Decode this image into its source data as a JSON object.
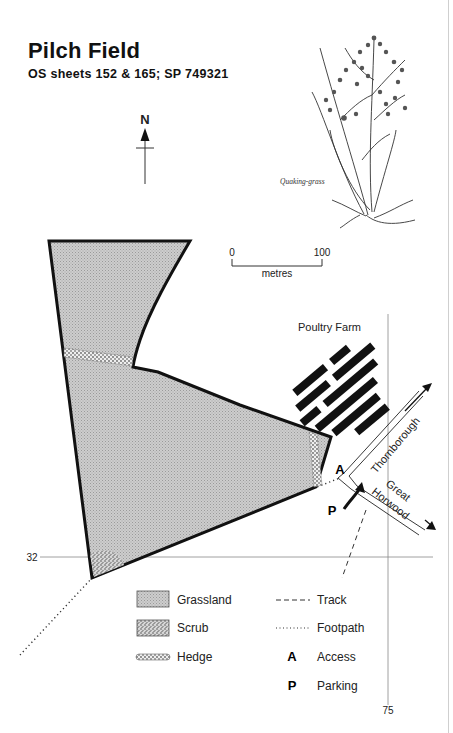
{
  "header": {
    "title": "Pilch Field",
    "subtitle": "OS sheets 152 & 165; SP 749321"
  },
  "north_arrow": {
    "label": "N"
  },
  "illustration": {
    "caption": "Quaking-grass"
  },
  "scale_bar": {
    "start": "0",
    "end": "100",
    "unit": "metres"
  },
  "map": {
    "places": {
      "poultry_farm": "Poultry Farm"
    },
    "roads": {
      "north": "Thornborough",
      "south_line1": "Great",
      "south_line2": "Horwood"
    },
    "markers": {
      "access": "A",
      "parking": "P"
    },
    "grid": {
      "northing": "32",
      "easting": "75"
    }
  },
  "colors": {
    "grassland": "#c8c8c8",
    "scrub": "#bdbdbd",
    "outline": "#111111"
  },
  "legend": {
    "items": [
      {
        "symbol": "grassland-swatch",
        "label": "Grassland"
      },
      {
        "symbol": "scrub-swatch",
        "label": "Scrub"
      },
      {
        "symbol": "hedge-swatch",
        "label": "Hedge"
      },
      {
        "symbol": "dashed-line",
        "label": "Track"
      },
      {
        "symbol": "dotted-line",
        "label": "Footpath"
      },
      {
        "symbol": "A",
        "label": "Access"
      },
      {
        "symbol": "P",
        "label": "Parking"
      }
    ]
  }
}
